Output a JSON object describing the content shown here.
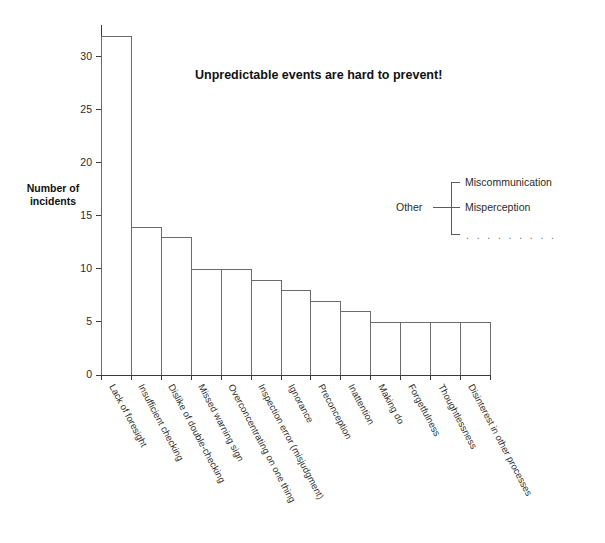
{
  "chart_data": {
    "type": "bar",
    "title": "Unpredictable events are hard to prevent!",
    "xlabel": "",
    "ylabel": "Number of\nincidents",
    "ylim": [
      0,
      33
    ],
    "yticks": [
      0,
      5,
      10,
      15,
      20,
      25,
      30
    ],
    "grid": false,
    "legend_position": "none",
    "categories": [
      "Lack of foresight",
      "Insufficient checking",
      "Dislike of double-checking",
      "Missed warning sign",
      "Overconcentrating on one thing",
      "Inspection error (misjudgment)",
      "Ignorance",
      "Preconception",
      "Inattention",
      "Making do",
      "Forgetfulness",
      "Thoughtlessness",
      "Disinterest in other processes"
    ],
    "values": [
      32,
      14,
      13,
      10,
      10,
      9,
      8,
      7,
      6,
      5,
      5,
      5,
      5
    ],
    "annotations": [
      {
        "label": "Other",
        "items": [
          "Miscommunication",
          "Misperception",
          ". . . . . . . . ."
        ]
      }
    ]
  },
  "axis": {
    "y_title_line1": "Number of",
    "y_title_line2": "incidents",
    "tick_labels": [
      "0",
      "5",
      "10",
      "15",
      "20",
      "25",
      "30"
    ]
  },
  "title": {
    "text": "Unpredictable events are hard to prevent!"
  },
  "annotation": {
    "other_label": "Other",
    "item_0": "Miscommunication",
    "item_1": "Misperception",
    "dots": ". . . . . . . . ."
  },
  "footer": {
    "caption": ""
  },
  "colors": {
    "axis": "#3a3a3a",
    "bar_outline": "#6b6b6b",
    "text": "#2b2b2b",
    "title": "#111111",
    "background": "#ffffff"
  }
}
